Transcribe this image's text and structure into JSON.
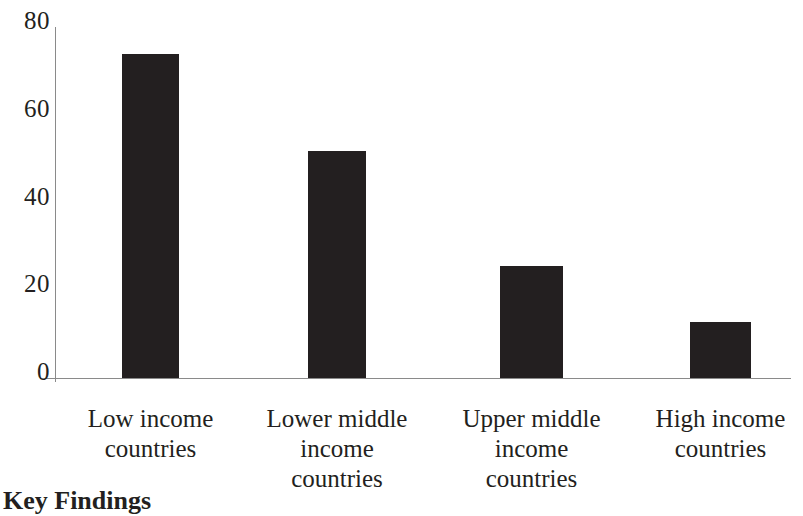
{
  "chart_data": {
    "type": "bar",
    "title": "",
    "xlabel": "",
    "ylabel": "",
    "categories": [
      "Low income countries",
      "Lower middle income countries",
      "Upper middle income countries",
      "High income countries"
    ],
    "category_lines": [
      [
        "Low income",
        "countries"
      ],
      [
        "Lower middle",
        "income",
        "countries"
      ],
      [
        "Upper middle",
        "income",
        "countries"
      ],
      [
        "High income",
        "countries"
      ]
    ],
    "values": [
      73.8,
      51.7,
      25.5,
      12.8
    ],
    "ylim": [
      0,
      80
    ],
    "yticks": [
      0,
      20,
      40,
      60,
      80
    ],
    "ytick_labels": [
      "0",
      "20",
      "40",
      "60",
      "80"
    ],
    "grid": false,
    "legend": false,
    "bar_color": "#231f20",
    "axis_color": "#8a8a8a"
  },
  "footer": {
    "heading": "Key Findings"
  }
}
